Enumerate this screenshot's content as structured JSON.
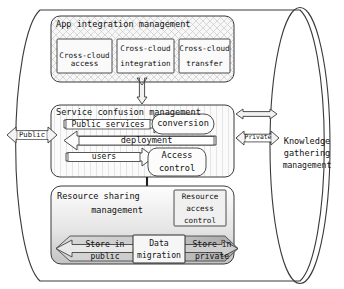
{
  "diagram": {
    "outer_container": {
      "name": "knowledge-gathering-cylinder",
      "label": "Knowledge\ngathering\nmanagement",
      "label_lines": [
        "Knowledge",
        "gathering",
        "management"
      ]
    },
    "side_arrows": {
      "left": {
        "label": "Public",
        "direction": "bidirectional"
      },
      "right": {
        "label": "Private",
        "direction": "bidirectional"
      }
    },
    "sections": [
      {
        "id": "app-integration",
        "title": "App integration management",
        "fill": "cross-hatch",
        "boxes": [
          {
            "id": "cross-cloud-access",
            "lines": [
              "Cross-cloud",
              "access"
            ]
          },
          {
            "id": "cross-cloud-integration",
            "lines": [
              "Cross-cloud",
              "integration"
            ]
          },
          {
            "id": "cross-cloud-transfer",
            "lines": [
              "Cross-cloud",
              "transfer"
            ]
          }
        ]
      },
      {
        "id": "service-confusion",
        "title": "Service confusion management",
        "fill": "vertical-lines",
        "boxes": [
          {
            "id": "public-services",
            "lines": [
              "Public services"
            ]
          },
          {
            "id": "conversion",
            "lines": [
              "conversion"
            ]
          },
          {
            "id": "deployment",
            "lines": [
              "deployment"
            ]
          },
          {
            "id": "users",
            "lines": [
              "users"
            ]
          },
          {
            "id": "access-control",
            "lines": [
              "Access",
              "control"
            ]
          }
        ]
      },
      {
        "id": "resource-sharing",
        "title": "Resource sharing\nmanagement",
        "title_lines": [
          "Resource sharing",
          "management"
        ],
        "fill": "gradient-gray",
        "boxes": [
          {
            "id": "resource-access-control",
            "lines": [
              "Resource",
              "access",
              "control"
            ]
          },
          {
            "id": "store-in-public",
            "lines": [
              "Store in",
              "public"
            ]
          },
          {
            "id": "data-migration",
            "lines": [
              "Data",
              "migration"
            ]
          },
          {
            "id": "store-in-private",
            "lines": [
              "Store in",
              "private"
            ]
          }
        ]
      }
    ],
    "connectors": [
      {
        "id": "app-to-service",
        "type": "vertical-double-arrow"
      },
      {
        "id": "service-to-right-upper",
        "type": "horizontal-double-arrow"
      },
      {
        "id": "service-to-right-lower",
        "type": "horizontal-double-arrow"
      },
      {
        "id": "access-control-to-resource",
        "type": "vertical-arrow"
      },
      {
        "id": "branch-to-resource-access-control",
        "type": "horizontal-arrow"
      }
    ],
    "colors": {
      "stroke": "#2b2b2b",
      "fill_light": "#f4f4f4",
      "fill_gray": "#b9b9b9",
      "hatch": "#b8b8b8"
    }
  }
}
